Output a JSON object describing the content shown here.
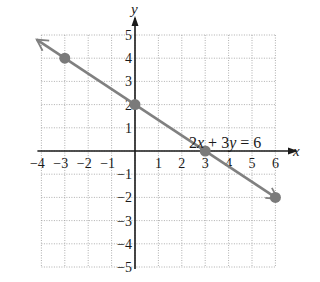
{
  "chart_data": {
    "type": "line",
    "title": "",
    "xlabel": "x",
    "ylabel": "y",
    "xlim": [
      -4,
      6
    ],
    "ylim": [
      -5,
      5
    ],
    "grid": true,
    "grid_style": "dotted",
    "x_ticks": [
      "−4",
      "−3",
      "−2",
      "−1",
      "1",
      "2",
      "3",
      "4",
      "5",
      "6"
    ],
    "y_ticks": [
      "5",
      "4",
      "3",
      "2",
      "1",
      "−1",
      "−2",
      "−3",
      "−4",
      "−5"
    ],
    "series": [
      {
        "name": "2x + 3y = 6",
        "points": [
          {
            "x": -3,
            "y": 4
          },
          {
            "x": 0,
            "y": 2
          },
          {
            "x": 3,
            "y": 0
          },
          {
            "x": 6,
            "y": -2
          }
        ],
        "arrows_both_ends": true,
        "color": "#808080"
      }
    ],
    "annotations": [
      {
        "text_parts": [
          "2",
          "x",
          " + 3",
          "y",
          " = 6"
        ],
        "x": 2.2,
        "y": 2
      }
    ]
  },
  "labels": {
    "x_axis": "x",
    "y_axis": "y",
    "equation": {
      "c1": "2",
      "v1": "x",
      "mid": " + 3",
      "v2": "y",
      "rhs": " = 6"
    }
  },
  "colors": {
    "line": "#808080",
    "point": "#7a7a7a",
    "axis": "#1a1a1a",
    "grid": "#9a9a9a"
  }
}
